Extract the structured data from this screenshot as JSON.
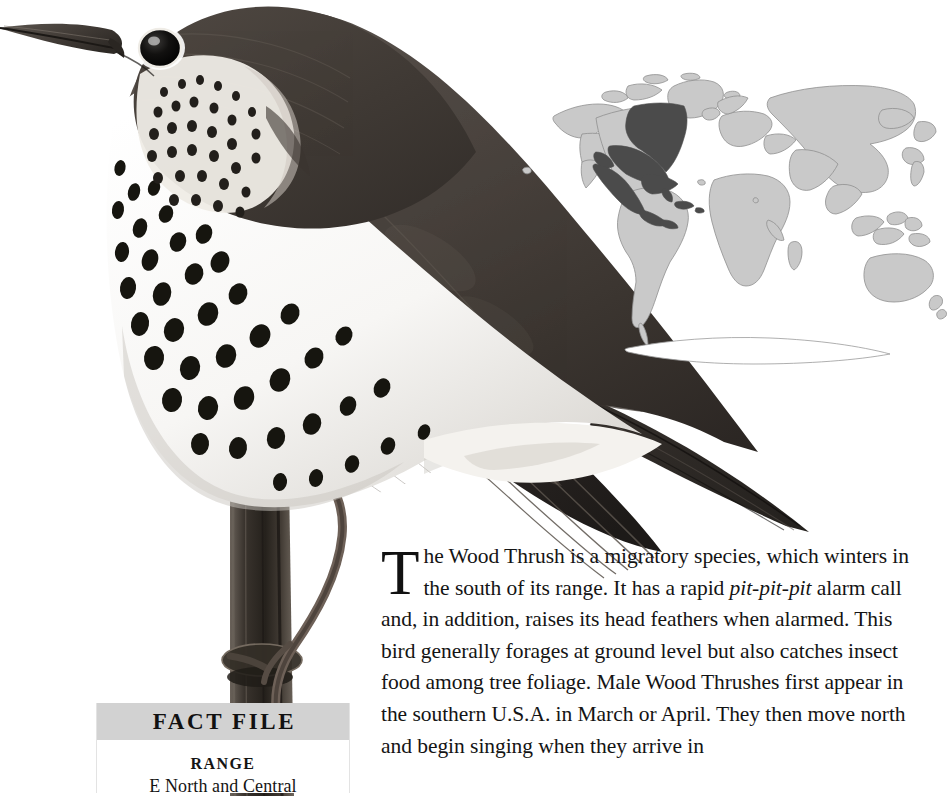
{
  "page": {
    "background_color": "#ffffff",
    "width": 950,
    "height": 793
  },
  "illustration": {
    "subject": "Wood Thrush perched on vertical branch",
    "name": "wood-thrush-illustration",
    "palette": {
      "upperparts": "#4a4440",
      "upperparts_dark": "#2e2a27",
      "wing_dark": "#221f1d",
      "underparts": "#fbfbfa",
      "spots": "#1a1a1a",
      "branch": "#403a34",
      "eye": "#0d0d0d"
    }
  },
  "map": {
    "name": "world-range-map",
    "projection": "winkel-tripel",
    "land_color": "#c9c9c9",
    "land_outline_color": "#8f8f8f",
    "range_color": "#4b4b4b",
    "ocean_color": "#ffffff",
    "range_region": "Eastern North America, Mexico and Central America"
  },
  "article": {
    "dropcap": "T",
    "paragraph_runs": [
      {
        "text": "he Wood Thrush is a migratory species, which winters in the south of its range. It has a rapid ",
        "style": "normal"
      },
      {
        "text": "pit-pit-pit",
        "style": "italic"
      },
      {
        "text": " alarm call and, in addition, raises its head feathers when alarmed. This bird generally forages at ground level but also catches insect food among tree foliage. Male Wood Thrushes first appear in the southern U.S.A. in March or April. They then move north and begin singing when they arrive in",
        "style": "normal"
      }
    ],
    "full_text": "The Wood Thrush is a migratory species, which winters in the south of its range. It has a rapid pit-pit-pit alarm call and, in addition, raises its head feathers when alarmed. This bird generally forages at ground level but also catches insect food among tree foliage. Male Wood Thrushes first appear in the southern U.S.A. in March or April. They then move north and begin singing when they arrive in"
  },
  "fact_file": {
    "header_title": "FACT FILE",
    "header_background": "#d2d2d2",
    "entries": [
      {
        "label": "RANGE",
        "value": "E North and Central"
      }
    ]
  }
}
